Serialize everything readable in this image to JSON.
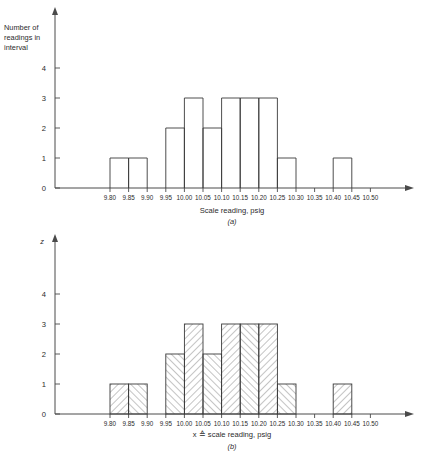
{
  "figure": {
    "panels": [
      {
        "id": "a",
        "caption": "(a)",
        "ylabel_lines": [
          "Number of",
          "readings in",
          "interval"
        ],
        "xlabel": "Scale reading, psig",
        "hatched": false
      },
      {
        "id": "b",
        "caption": "(b)",
        "ylabel_lines": [
          "z"
        ],
        "xlabel_symbol": "x ≙ scale reading, psig",
        "xlabel": "scale reading, psig",
        "hatched": true
      }
    ],
    "y_ticks": [
      "0",
      "1",
      "2",
      "3",
      "4"
    ],
    "x_ticks": [
      "9.80",
      "9.85",
      "9.90",
      "9.95",
      "10.00",
      "10.05",
      "10.10",
      "10.15",
      "10.20",
      "10.25",
      "10.30",
      "10.35",
      "10.40",
      "10.45",
      "10.50"
    ]
  },
  "chart_data": {
    "type": "bar",
    "title": "",
    "subtitle": "",
    "xlabel": "Scale reading, psig",
    "ylabel": "Number of readings in interval",
    "ylim": [
      0,
      4
    ],
    "grid": false,
    "legend": "none",
    "note": "Histogram of 20 scale readings; bins are 0.05 psig wide. Panel (a) outline bars, panel (b) identical data drawn with diagonal hatching.",
    "bin_edges": [
      9.8,
      9.85,
      9.9,
      9.95,
      10.0,
      10.05,
      10.1,
      10.15,
      10.2,
      10.25,
      10.3,
      10.35,
      10.4,
      10.45,
      10.5
    ],
    "bin_labels": [
      "9.80-9.85",
      "9.85-9.90",
      "9.90-9.95",
      "9.95-10.00",
      "10.00-10.05",
      "10.05-10.10",
      "10.10-10.15",
      "10.15-10.20",
      "10.20-10.25",
      "10.25-10.30",
      "10.30-10.35",
      "10.35-10.40",
      "10.40-10.45",
      "10.45-10.50"
    ],
    "categories": [
      "9.80",
      "9.85",
      "9.90",
      "9.95",
      "10.00",
      "10.05",
      "10.10",
      "10.15",
      "10.20",
      "10.25",
      "10.30",
      "10.35",
      "10.40",
      "10.45"
    ],
    "values": [
      1,
      1,
      0,
      2,
      3,
      2,
      3,
      3,
      3,
      1,
      0,
      0,
      1,
      0
    ],
    "series": [
      {
        "name": "panel-a",
        "values": [
          1,
          1,
          0,
          2,
          3,
          2,
          3,
          3,
          3,
          1,
          0,
          0,
          1,
          0
        ]
      },
      {
        "name": "panel-b",
        "values": [
          1,
          1,
          0,
          2,
          3,
          2,
          3,
          3,
          3,
          1,
          0,
          0,
          1,
          0
        ]
      }
    ],
    "x_tick_labels": [
      "9.80",
      "9.85",
      "9.90",
      "9.95",
      "10.00",
      "10.05",
      "10.10",
      "10.15",
      "10.20",
      "10.25",
      "10.30",
      "10.35",
      "10.40",
      "10.45",
      "10.50"
    ],
    "y_tick_labels": [
      "0",
      "1",
      "2",
      "3",
      "4"
    ]
  }
}
